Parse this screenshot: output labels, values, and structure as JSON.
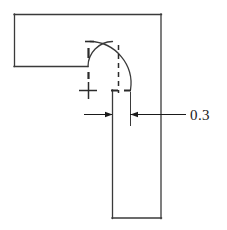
{
  "drawing": {
    "type": "engineering-cross-section",
    "background_color": "#ffffff",
    "line_color": "#3a3a3a",
    "centerline_color": "#2b2b2b",
    "dimension_color": "#1a1a1a",
    "dimensions": [
      {
        "label": "0.3",
        "name": "fillet-offset-dimension",
        "arrow_style": "inward-pair",
        "leader": "horizontal-right"
      }
    ],
    "annotations": {
      "dimension_value": "0.3"
    },
    "geometry": {
      "outline_points": "14,14 161,14 161,218 112,218 112,66 14,66",
      "horizontal_arm": {
        "x": 14,
        "y": 14,
        "width": 147,
        "height": 52
      },
      "vertical_arm": {
        "x": 112,
        "y": 14,
        "width": 49,
        "height": 204
      },
      "inner_fillet": {
        "cx": 112,
        "cy": 42,
        "r": 24,
        "start": "88,66",
        "end": "112,42"
      },
      "outer_fillet": {
        "cx": 130,
        "cy": 41,
        "r": 42,
        "start": "88,41",
        "end": "130,90"
      },
      "center_mark": {
        "x": 88,
        "y": 90,
        "arm": 9
      },
      "vertical_centerline": {
        "x": 118.5,
        "y1": 44,
        "y2": 92
      },
      "horizontal_centerline_tick": {
        "x1": 112,
        "x2": 130,
        "y": 90
      },
      "top_tick": {
        "x1": 86,
        "x2": 94,
        "y": 41
      },
      "upper_tick": {
        "x": 88,
        "y1": 47,
        "y2": 58
      },
      "lower_tick": {
        "x": 88,
        "y1": 74,
        "y2": 82
      },
      "extension_line_left": {
        "x": 112,
        "y1": 90,
        "y2": 126
      },
      "extension_line_right": {
        "x": 130,
        "y1": 90,
        "y2": 126
      },
      "dimension_line_y": 114,
      "dim_left_segment": {
        "x1": 84,
        "x2": 112
      },
      "dim_right_segment": {
        "x1": 130,
        "x2": 186
      },
      "text_position": {
        "x": 190,
        "y": 119
      }
    }
  }
}
